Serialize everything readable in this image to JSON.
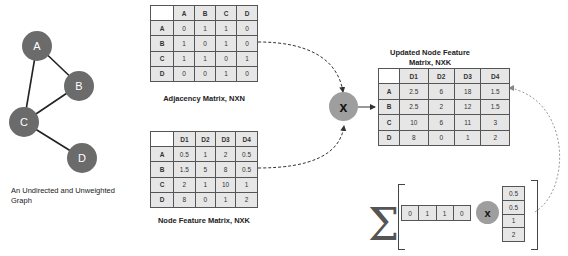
{
  "graph": {
    "caption_line1": "An Undirected and Unweighted",
    "caption_line2": "Graph",
    "nodes": [
      {
        "label": "A",
        "x": 37,
        "y": 45
      },
      {
        "label": "B",
        "x": 79,
        "y": 85
      },
      {
        "label": "C",
        "x": 24,
        "y": 122
      },
      {
        "label": "D",
        "x": 82,
        "y": 158
      }
    ],
    "edges": [
      [
        "A",
        "B"
      ],
      [
        "A",
        "C"
      ],
      [
        "B",
        "C"
      ],
      [
        "C",
        "D"
      ]
    ]
  },
  "adjacency": {
    "caption": "Adjacency Matrix, NXN",
    "columns": [
      "A",
      "B",
      "C",
      "D"
    ],
    "rows": [
      {
        "label": "A",
        "values": [
          "0",
          "1",
          "1",
          "0"
        ]
      },
      {
        "label": "B",
        "values": [
          "1",
          "0",
          "1",
          "0"
        ]
      },
      {
        "label": "C",
        "values": [
          "1",
          "1",
          "0",
          "1"
        ]
      },
      {
        "label": "D",
        "values": [
          "0",
          "0",
          "1",
          "0"
        ]
      }
    ]
  },
  "features": {
    "caption": "Node Feature Matrix, NXK",
    "columns": [
      "D1",
      "D2",
      "D3",
      "D4"
    ],
    "rows": [
      {
        "label": "A",
        "values": [
          "0.5",
          "1",
          "2",
          "0.5"
        ]
      },
      {
        "label": "B",
        "values": [
          "1.5",
          "5",
          "8",
          "0.5"
        ]
      },
      {
        "label": "C",
        "values": [
          "2",
          "1",
          "10",
          "1"
        ]
      },
      {
        "label": "D",
        "values": [
          "8",
          "0",
          "1",
          "2"
        ]
      }
    ]
  },
  "updated": {
    "caption_line1": "Updated Node Feature",
    "caption_line2": "Matrix, NXK",
    "columns": [
      "D1",
      "D2",
      "D3",
      "D4"
    ],
    "rows": [
      {
        "label": "A",
        "values": [
          "2.5",
          "6",
          "18",
          "1.5"
        ]
      },
      {
        "label": "B",
        "values": [
          "2.5",
          "2",
          "12",
          "1.5"
        ]
      },
      {
        "label": "C",
        "values": [
          "10",
          "6",
          "11",
          "3"
        ]
      },
      {
        "label": "D",
        "values": [
          "8",
          "0",
          "1",
          "2"
        ]
      }
    ]
  },
  "operator": {
    "multiply_symbol": "x"
  },
  "sum_example": {
    "sigma": "Σ",
    "row_vector": [
      "0",
      "1",
      "1",
      "0"
    ],
    "column_vector": [
      "0.5",
      "0.5",
      "1",
      "2"
    ],
    "multiply_symbol": "x"
  }
}
